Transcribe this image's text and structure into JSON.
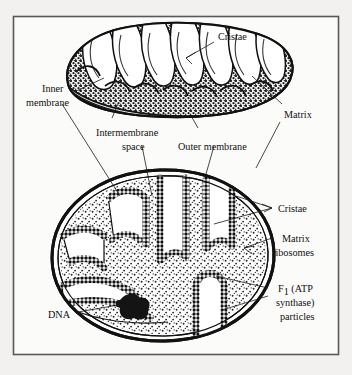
{
  "figure": {
    "frame": {
      "x": 13,
      "y": 16,
      "width": 326,
      "height": 339,
      "border_color": "#58585a"
    },
    "background_color": "#f2f1ef",
    "ink_color": "#1a1a1a"
  },
  "labels": {
    "cristae_top": "Cristae",
    "inner_membrane_line1": "Inner",
    "inner_membrane_line2": "membrane",
    "intermembrane_line1": "Intermembrane",
    "intermembrane_line2": "space",
    "outer_membrane": "Outer membrane",
    "matrix": "Matrix",
    "cristae_bottom": "Cristae",
    "matrix_ribosomes_line1": "Matrix",
    "matrix_ribosomes_line2": "ribosomes",
    "f1_line1_main": "F",
    "f1_line1_sub": "1",
    "f1_line1_rest": " (ATP",
    "f1_line2": "synthase)",
    "f1_line3": "particles",
    "dna": "DNA"
  },
  "diagrams": {
    "top_view": {
      "name": "three-dimensional cutaway mitochondrion",
      "style": "dark stippled matrix with white finger-like cristae invaginations"
    },
    "bottom_view": {
      "name": "mitochondrion cross-section",
      "style": "light stippled matrix, beaded cristae membranes, dark DNA nucleoid"
    }
  }
}
